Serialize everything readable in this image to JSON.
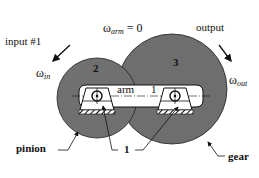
{
  "diagram": {
    "type": "planetary gear train schematic (arm fixed)",
    "colors": {
      "gear_fill": "#6e6e6e",
      "pinion_fill": "#707070",
      "arm_fill": "#ffffff",
      "stroke": "#111111",
      "background": "#ffffff"
    },
    "labels": {
      "input": "input #1",
      "omega_symbol": "ω",
      "omega_in_sub": "in",
      "omega_arm_sub": "arm",
      "omega_arm_value": " = 0",
      "output": "output",
      "omega_out_sub": "out",
      "arm": "arm",
      "arm_link_number": "1",
      "pinion_number": "2",
      "gear_number": "3",
      "ground_number": "1",
      "pinion": "pinion",
      "gear": "gear"
    },
    "components": [
      {
        "id": "pinion",
        "number": "2",
        "role": "input",
        "cx": 97,
        "cy": 98,
        "r": 40
      },
      {
        "id": "gear",
        "number": "3",
        "role": "output",
        "cx": 172,
        "cy": 89,
        "r": 55
      },
      {
        "id": "arm",
        "number": "1",
        "role": "fixed carrier"
      }
    ]
  }
}
